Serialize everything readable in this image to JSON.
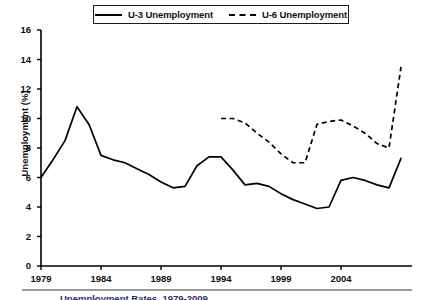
{
  "legend": {
    "position": "top-center",
    "entries": [
      {
        "label": "U-3 Unemployment",
        "style": "solid",
        "icon": "solid-line-swatch"
      },
      {
        "label": "U-6 Unemployment",
        "style": "dashed",
        "icon": "dashed-line-swatch"
      }
    ]
  },
  "axes": {
    "ylabel": "Unemployment (%)",
    "yticks": [
      "16",
      "14",
      "12",
      "10",
      "8",
      "6",
      "4",
      "2",
      "0"
    ],
    "xticks": [
      "1979",
      "1984",
      "1989",
      "1994",
      "1999",
      "2004"
    ]
  },
  "caption": "Unemployment Rates, 1979-2009",
  "colors": {
    "line": "#000000",
    "axis": "#000000",
    "caption_rule": "#9a9a9a",
    "background": "#ffffff"
  },
  "chart_data": {
    "type": "line",
    "title": "",
    "xlabel": "",
    "ylabel": "Unemployment (%)",
    "xlim": [
      1979,
      2009
    ],
    "ylim": [
      0,
      16
    ],
    "yticks": [
      0,
      2,
      4,
      6,
      8,
      10,
      12,
      14,
      16
    ],
    "xticks": [
      1979,
      1984,
      1989,
      1994,
      1999,
      2004
    ],
    "grid": false,
    "legend_position": "top-center",
    "x": [
      1979,
      1980,
      1981,
      1982,
      1983,
      1984,
      1985,
      1986,
      1987,
      1988,
      1989,
      1990,
      1991,
      1992,
      1993,
      1994,
      1995,
      1996,
      1997,
      1998,
      1999,
      2000,
      2001,
      2002,
      2003,
      2004,
      2005,
      2006,
      2007,
      2008,
      2009
    ],
    "series": [
      {
        "name": "U-3 Unemployment",
        "style": "solid",
        "x": [
          1979,
          1980,
          1981,
          1982,
          1983,
          1984,
          1985,
          1986,
          1987,
          1988,
          1989,
          1990,
          1991,
          1992,
          1993,
          1994,
          1995,
          1996,
          1997,
          1998,
          1999,
          2000,
          2001,
          2002,
          2003,
          2004,
          2005,
          2006,
          2007,
          2008,
          2009
        ],
        "values": [
          6.0,
          7.2,
          8.5,
          10.8,
          9.6,
          7.5,
          7.2,
          7.0,
          6.6,
          6.2,
          5.7,
          5.3,
          5.4,
          6.8,
          7.4,
          7.4,
          6.5,
          5.5,
          5.6,
          5.4,
          4.9,
          4.5,
          4.2,
          3.9,
          4.0,
          5.8,
          6.0,
          5.8,
          5.5,
          5.3,
          7.3
        ],
        "values_ordered_note": "values read off plotted polyline at each year"
      },
      {
        "name": "U-6 Unemployment",
        "style": "dashed",
        "x": [
          1994,
          1995,
          1996,
          1997,
          1998,
          1999,
          2000,
          2001,
          2002,
          2003,
          2004,
          2005,
          2006,
          2007,
          2008,
          2009
        ],
        "values": [
          10.0,
          10.0,
          9.7,
          9.0,
          8.4,
          7.6,
          7.0,
          7.0,
          9.6,
          9.8,
          9.9,
          9.5,
          9.0,
          8.3,
          8.0,
          13.5
        ]
      }
    ]
  }
}
